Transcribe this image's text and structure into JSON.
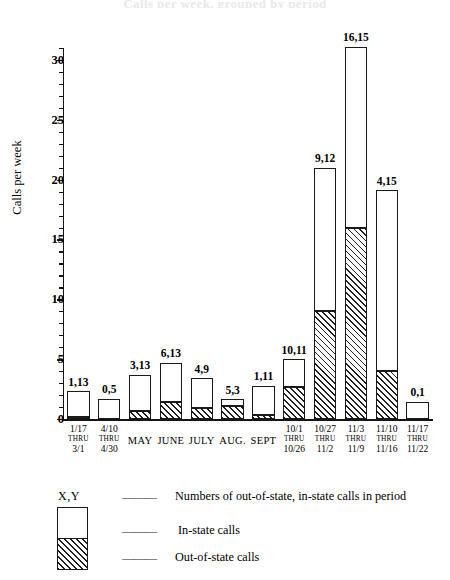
{
  "ghost_title": "Calls per week, grouped by period",
  "chart_data": {
    "type": "bar",
    "title": "",
    "xlabel": "",
    "ylabel": "Calls per week",
    "ylim": [
      0,
      31
    ],
    "ytick_values": [
      0,
      5,
      10,
      15,
      20,
      25,
      30
    ],
    "ytick_labels": [
      "0",
      "5",
      "10",
      "15",
      "20",
      "25",
      "30"
    ],
    "minor_tick_step": 1,
    "grid": false,
    "legend_position": "below-plot",
    "stacked": true,
    "series": [
      {
        "name": "Out-of-state calls",
        "fill": "hatched",
        "values": [
          0.16,
          0.0,
          0.7,
          1.45,
          0.95,
          1.05,
          0.3,
          2.7,
          9.0,
          16.0,
          4.0,
          0.0
        ]
      },
      {
        "name": "In-state calls",
        "fill": "white",
        "values": [
          2.14,
          1.7,
          3.0,
          3.25,
          2.45,
          0.6,
          2.5,
          2.3,
          12.0,
          15.1,
          15.1,
          1.45
        ]
      }
    ],
    "categories": [
      "1/17 THRU 3/1",
      "4/10 THRU 4/30",
      "May",
      "June",
      "July",
      "Aug.",
      "Sept",
      "10/1 THRU 10/26",
      "10/27 THRU 11/2",
      "11/3 THRU 11/9",
      "11/10 THRU 11/16",
      "11/17 THRU 11/22"
    ],
    "bar_labels": [
      "1,13",
      "0,5",
      "3,13",
      "6,13",
      "4,9",
      "5,3",
      "1,11",
      "10,11",
      "9,12",
      "16,15",
      "4,15",
      "0,1"
    ],
    "annotations": [
      {
        "label": "1,13",
        "out_of_state": 1,
        "in_state": 13
      },
      {
        "label": "0,5",
        "out_of_state": 0,
        "in_state": 5
      },
      {
        "label": "3,13",
        "out_of_state": 3,
        "in_state": 13
      },
      {
        "label": "6,13",
        "out_of_state": 6,
        "in_state": 13
      },
      {
        "label": "4,9",
        "out_of_state": 4,
        "in_state": 9
      },
      {
        "label": "5,3",
        "out_of_state": 5,
        "in_state": 3
      },
      {
        "label": "1,11",
        "out_of_state": 1,
        "in_state": 11
      },
      {
        "label": "10,11",
        "out_of_state": 10,
        "in_state": 11
      },
      {
        "label": "9,12",
        "out_of_state": 9,
        "in_state": 12
      },
      {
        "label": "16,15",
        "out_of_state": 16,
        "in_state": 15
      },
      {
        "label": "4,15",
        "out_of_state": 4,
        "in_state": 15
      },
      {
        "label": "0,1",
        "out_of_state": 0,
        "in_state": 1
      }
    ]
  },
  "xaxis": {
    "categories": [
      {
        "line1": "1/17",
        "line2": "THRU",
        "line3": "3/1",
        "multiline": true
      },
      {
        "line1": "4/10",
        "line2": "THRU",
        "line3": "4/30",
        "multiline": true
      },
      {
        "line1": "MAY",
        "multiline": false
      },
      {
        "line1": "JUNE",
        "multiline": false
      },
      {
        "line1": "JULY",
        "multiline": false
      },
      {
        "line1": "AUG.",
        "multiline": false
      },
      {
        "line1": "SEPT",
        "multiline": false
      },
      {
        "line1": "10/1",
        "line2": "THRU",
        "line3": "10/26",
        "multiline": true
      },
      {
        "line1": "10/27",
        "line2": "THRU",
        "line3": "11/2",
        "multiline": true
      },
      {
        "line1": "11/3",
        "line2": "THRU",
        "line3": "11/9",
        "multiline": true
      },
      {
        "line1": "11/10",
        "line2": "THRU",
        "line3": "11/16",
        "multiline": true
      },
      {
        "line1": "11/17",
        "line2": "THRU",
        "line3": "11/22",
        "multiline": true
      }
    ]
  },
  "legend": {
    "xy_symbol": "X,Y",
    "dash": "———",
    "entries": [
      {
        "label": "Numbers of out-of-state, in-state calls in period"
      },
      {
        "label": "In-state calls"
      },
      {
        "label": "Out-of-state calls"
      }
    ]
  },
  "colors": {
    "ink": "#1a1a1a",
    "paper": "#ffffff",
    "hatch": "#1d1d1d"
  }
}
